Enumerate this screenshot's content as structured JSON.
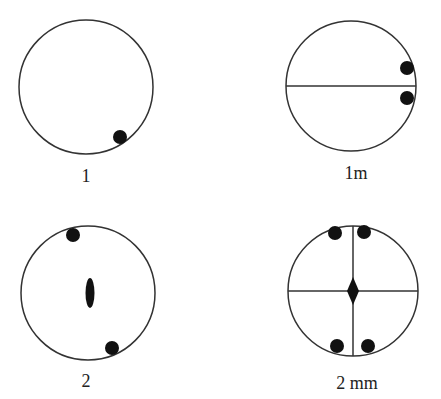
{
  "diagrams": [
    {
      "id": "1",
      "label": "1",
      "circle": {
        "cx": 86,
        "cy": 87,
        "r": 67
      },
      "lines": [],
      "dots": [
        {
          "cx": 120,
          "cy": 137
        }
      ],
      "center_symbol": "none",
      "label_pos": {
        "x": 86,
        "y": 182
      }
    },
    {
      "id": "1m",
      "label": "1m",
      "circle": {
        "cx": 351,
        "cy": 86,
        "r": 65
      },
      "lines": [
        {
          "x1": 286,
          "y1": 86,
          "x2": 416,
          "y2": 86
        }
      ],
      "dots": [
        {
          "cx": 407,
          "cy": 68
        },
        {
          "cx": 407,
          "cy": 98
        }
      ],
      "center_symbol": "none",
      "label_pos": {
        "x": 356,
        "y": 179
      }
    },
    {
      "id": "2",
      "label": "2",
      "circle": {
        "cx": 88,
        "cy": 293,
        "r": 67
      },
      "lines": [],
      "dots": [
        {
          "cx": 73,
          "cy": 235
        },
        {
          "cx": 112,
          "cy": 348
        }
      ],
      "center_symbol": "ellipse",
      "label_pos": {
        "x": 86,
        "y": 387
      }
    },
    {
      "id": "2mm",
      "label": "2 mm",
      "circle": {
        "cx": 353,
        "cy": 291,
        "r": 65
      },
      "lines": [
        {
          "x1": 288,
          "y1": 291,
          "x2": 418,
          "y2": 291
        },
        {
          "x1": 353,
          "y1": 224,
          "x2": 353,
          "y2": 359
        }
      ],
      "dots": [
        {
          "cx": 335,
          "cy": 233
        },
        {
          "cx": 364,
          "cy": 232
        },
        {
          "cx": 337,
          "cy": 346
        },
        {
          "cx": 368,
          "cy": 346
        }
      ],
      "center_symbol": "diamond",
      "label_pos": {
        "x": 357,
        "y": 389
      }
    }
  ],
  "colors": {
    "stroke": "#333333",
    "fill": "#111111"
  }
}
